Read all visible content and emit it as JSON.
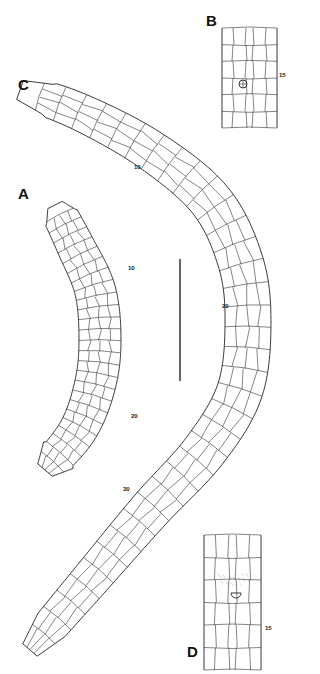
{
  "figure": {
    "panels": {
      "A": {
        "label": "A",
        "segment_labels": [
          {
            "text": "10",
            "x": 128,
            "y": 268
          },
          {
            "text": "20",
            "x": 129,
            "y": 416
          }
        ]
      },
      "B": {
        "label": "B",
        "segment_labels": [
          {
            "text": "15",
            "x": 279,
            "y": 73
          }
        ]
      },
      "C": {
        "label": "C",
        "segment_labels": [
          {
            "text": "10",
            "x": 133,
            "y": 167
          },
          {
            "text": "20",
            "x": 222,
            "y": 306
          },
          {
            "text": "30",
            "x": 123,
            "y": 489
          }
        ]
      },
      "D": {
        "label": "D",
        "segment_labels": [
          {
            "text": "15",
            "x": 265,
            "y": 628
          }
        ]
      }
    },
    "scale_bar": {
      "x": 180,
      "y1": 259,
      "y2": 381
    },
    "colors": {
      "line": "#222222",
      "background": "#ffffff"
    }
  }
}
